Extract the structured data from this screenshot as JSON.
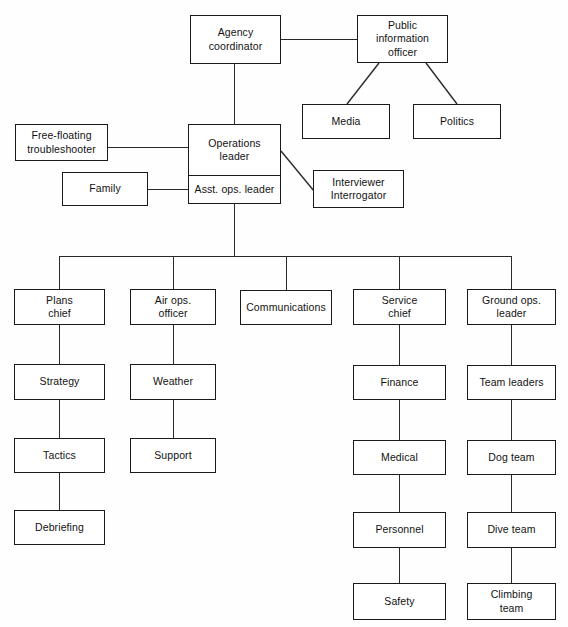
{
  "chart": {
    "type": "org-chart",
    "line_color": "#2a2a2a",
    "box_border_color": "#1a1a1a",
    "background_color": "#ffffff"
  },
  "nodes": {
    "agency_coordinator": {
      "label": "Agency\ncoordinator"
    },
    "public_information_officer": {
      "label": "Public\ninformation\nofficer"
    },
    "media": {
      "label": "Media"
    },
    "politics": {
      "label": "Politics"
    },
    "free_floating_troubleshooter": {
      "label": "Free-floating\ntroubleshooter"
    },
    "family": {
      "label": "Family"
    },
    "operations_leader": {
      "label": "Operations\nleader"
    },
    "asst_ops_leader": {
      "label": "Asst. ops. leader"
    },
    "interviewer_interrogator": {
      "label": "Interviewer\nInterrogator"
    },
    "plans_chief": {
      "label": "Plans\nchief"
    },
    "air_ops_officer": {
      "label": "Air ops.\nofficer"
    },
    "communications": {
      "label": "Communications"
    },
    "service_chief": {
      "label": "Service\nchief"
    },
    "ground_ops_leader": {
      "label": "Ground ops.\nleader"
    },
    "strategy": {
      "label": "Strategy"
    },
    "tactics": {
      "label": "Tactics"
    },
    "debriefing": {
      "label": "Debriefing"
    },
    "weather": {
      "label": "Weather"
    },
    "support": {
      "label": "Support"
    },
    "finance": {
      "label": "Finance"
    },
    "medical": {
      "label": "Medical"
    },
    "personnel": {
      "label": "Personnel"
    },
    "safety": {
      "label": "Safety"
    },
    "team_leaders": {
      "label": "Team leaders"
    },
    "dog_team": {
      "label": "Dog team"
    },
    "dive_team": {
      "label": "Dive team"
    },
    "climbing_team": {
      "label": "Climbing\nteam"
    }
  }
}
